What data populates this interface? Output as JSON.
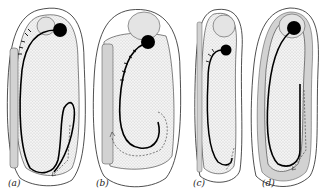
{
  "figure": {
    "panels": [
      {
        "id": "a",
        "label": "(a)"
      },
      {
        "id": "b",
        "label": "(b)"
      },
      {
        "id": "c",
        "label": "(c)"
      },
      {
        "id": "d",
        "label": "(d)"
      }
    ]
  },
  "colors": {
    "outline": "#222222",
    "stipple": "#d9d9d9",
    "yolk_fill": "#ececec",
    "hatch": "#bdbdbd",
    "solid": "#000000"
  }
}
